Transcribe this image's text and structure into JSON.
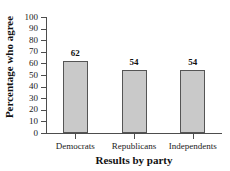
{
  "chart_data": {
    "type": "bar",
    "title": "",
    "xlabel": "Results by party",
    "ylabel": "Percentage who agree",
    "categories": [
      "Democrats",
      "Republicans",
      "Independents"
    ],
    "values": [
      62,
      54,
      54
    ],
    "data_labels": [
      "62",
      "54",
      "54"
    ],
    "ylim": [
      0,
      100
    ],
    "ytick_values": [
      100,
      90,
      80,
      70,
      60,
      50,
      40,
      30,
      20,
      10,
      0
    ],
    "ytick_labels": [
      "100",
      "90",
      "80",
      "70",
      "60",
      "50",
      "40",
      "30",
      "20",
      "10",
      "0"
    ],
    "grid": false,
    "legend": false,
    "legend_position": "none",
    "bar_fill_color": "#c9c9c9",
    "bar_edge_color": "#555555",
    "axis_color": "#4d4d4d",
    "background_color": "#ffffff"
  }
}
